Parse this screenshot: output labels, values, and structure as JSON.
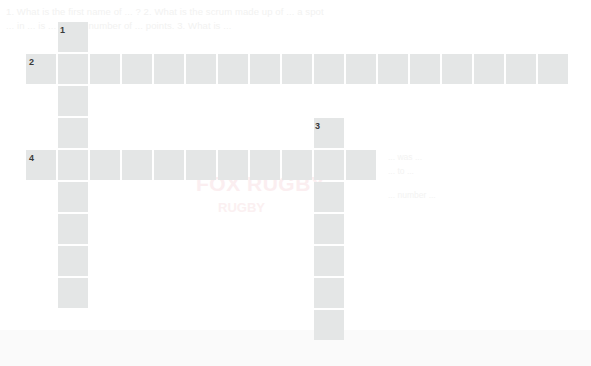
{
  "page": {
    "background_color": "#ffffff",
    "cell_color": "#e4e6e6",
    "clue_number_color": "#3a3a3a",
    "width": 591,
    "height": 366
  },
  "ghost_text": {
    "top_line_1": "1. What is the first name of ... ? 2. What is the scrum made up of ... a spot",
    "top_line_2": "... in ... is ... in ... a number of ... points. 3. What is ...",
    "right_line_1": "... was ...",
    "right_line_2": "... to ...",
    "right_line_3": "... number ...",
    "watermark_title": "FOX RUGBY",
    "watermark_sub": "RUGBY"
  },
  "crossword": {
    "cell_size": 30,
    "gap": 2,
    "entries": [
      {
        "number": "1",
        "direction": "down",
        "start_col": 1,
        "start_row": 0,
        "length": 9
      },
      {
        "number": "2",
        "direction": "across",
        "start_col": 0,
        "start_row": 1,
        "length": 18
      },
      {
        "number": "3",
        "direction": "down",
        "start_col": 9,
        "start_row": 3,
        "length": 7
      },
      {
        "number": "4",
        "direction": "across",
        "start_col": 0,
        "start_row": 4,
        "length": 11
      }
    ],
    "clue_numbers": [
      {
        "label": "1",
        "x": 60,
        "y": 26
      },
      {
        "label": "2",
        "x": 29,
        "y": 58
      },
      {
        "label": "3",
        "x": 315,
        "y": 122
      },
      {
        "label": "4",
        "x": 29,
        "y": 154
      }
    ],
    "cells": [
      {
        "x": 58,
        "y": 22
      },
      {
        "x": 26,
        "y": 54
      },
      {
        "x": 58,
        "y": 54
      },
      {
        "x": 90,
        "y": 54
      },
      {
        "x": 122,
        "y": 54
      },
      {
        "x": 154,
        "y": 54
      },
      {
        "x": 186,
        "y": 54
      },
      {
        "x": 218,
        "y": 54
      },
      {
        "x": 250,
        "y": 54
      },
      {
        "x": 282,
        "y": 54
      },
      {
        "x": 314,
        "y": 54
      },
      {
        "x": 346,
        "y": 54
      },
      {
        "x": 378,
        "y": 54
      },
      {
        "x": 410,
        "y": 54
      },
      {
        "x": 442,
        "y": 54
      },
      {
        "x": 474,
        "y": 54
      },
      {
        "x": 506,
        "y": 54
      },
      {
        "x": 538,
        "y": 54
      },
      {
        "x": 58,
        "y": 86
      },
      {
        "x": 58,
        "y": 118
      },
      {
        "x": 314,
        "y": 118
      },
      {
        "x": 26,
        "y": 150
      },
      {
        "x": 58,
        "y": 150
      },
      {
        "x": 90,
        "y": 150
      },
      {
        "x": 122,
        "y": 150
      },
      {
        "x": 154,
        "y": 150
      },
      {
        "x": 186,
        "y": 150
      },
      {
        "x": 218,
        "y": 150
      },
      {
        "x": 250,
        "y": 150
      },
      {
        "x": 282,
        "y": 150
      },
      {
        "x": 314,
        "y": 150
      },
      {
        "x": 346,
        "y": 150
      },
      {
        "x": 58,
        "y": 182
      },
      {
        "x": 314,
        "y": 182
      },
      {
        "x": 58,
        "y": 214
      },
      {
        "x": 314,
        "y": 214
      },
      {
        "x": 58,
        "y": 246
      },
      {
        "x": 314,
        "y": 246
      },
      {
        "x": 58,
        "y": 278
      },
      {
        "x": 314,
        "y": 278
      },
      {
        "x": 314,
        "y": 310
      }
    ]
  }
}
